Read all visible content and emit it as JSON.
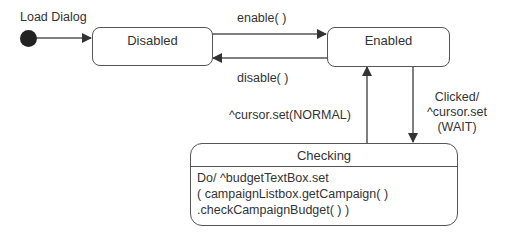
{
  "diagram": {
    "type": "uml-state-machine",
    "initial": {
      "label": "Load Dialog"
    },
    "states": [
      {
        "id": "disabled",
        "name": "Disabled"
      },
      {
        "id": "enabled",
        "name": "Enabled"
      },
      {
        "id": "checking",
        "name": "Checking",
        "activity_lines": [
          "Do/ ^budgetTextBox.set",
          "( campaignListbox.getCampaign( )",
          ".checkCampaignBudget( ) )"
        ]
      }
    ],
    "transitions": [
      {
        "from": "initial",
        "to": "disabled",
        "label": ""
      },
      {
        "from": "disabled",
        "to": "enabled",
        "label": "enable( )"
      },
      {
        "from": "enabled",
        "to": "disabled",
        "label": "disable( )"
      },
      {
        "from": "enabled",
        "to": "checking",
        "label_lines": [
          "Clicked/",
          "^cursor.set",
          "(WAIT)"
        ]
      },
      {
        "from": "checking",
        "to": "enabled",
        "label": "^cursor.set(NORMAL)"
      }
    ],
    "colors": {
      "line": "#555555",
      "text": "#333333",
      "initial_dot": "#222222"
    }
  }
}
